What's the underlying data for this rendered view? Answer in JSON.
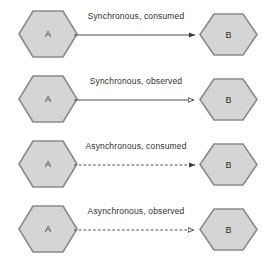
{
  "diagram": {
    "colors": {
      "node_fill": "#d5d5d5",
      "node_stroke": "#8a8a8a",
      "line": "#4a4a4a",
      "text": "#2f2f2f",
      "background": "#ffffff"
    },
    "rows": [
      {
        "label": "Synchronous, consumed",
        "source": "A",
        "target": "B",
        "line_style": "solid",
        "arrowhead": "filled"
      },
      {
        "label": "Synchronous, observed",
        "source": "A",
        "target": "B",
        "line_style": "solid",
        "arrowhead": "hollow"
      },
      {
        "label": "Asynchronous, consumed",
        "source": "A",
        "target": "B",
        "line_style": "dashed",
        "arrowhead": "filled"
      },
      {
        "label": "Asynchronous, observed",
        "source": "A",
        "target": "B",
        "line_style": "dashed",
        "arrowhead": "hollow"
      }
    ]
  }
}
